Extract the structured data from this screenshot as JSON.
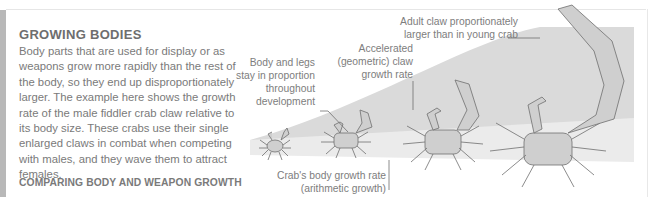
{
  "section": {
    "heading": "GROWING BODIES",
    "body": "Body parts that are used for display or as weapons grow more rapidly than the rest of the body, so they end up disproportionately larger. The example here shows the growth rate of the male fiddler crab claw relative to its body size. These crabs use their single enlarged claws in combat when competing with males, and they wave them to attract females.",
    "subheading": "COMPARING BODY AND WEAPON GROWTH"
  },
  "diagram": {
    "labels": {
      "adult_claw_line1": "Adult claw proportionately",
      "adult_claw_line2": "larger than in young crab",
      "accelerated_line1": "Accelerated",
      "accelerated_line2": "(geometric) claw",
      "accelerated_line3": "growth rate",
      "body_legs_line1": "Body and legs",
      "body_legs_line2": "stay in proportion",
      "body_legs_line3": "throughout",
      "body_legs_line4": "development",
      "body_growth_line1": "Crab's body growth rate",
      "body_growth_line2": "(arithmetic growth)"
    },
    "crabs": [
      {
        "stage": "young",
        "size": "smallest"
      },
      {
        "stage": "juvenile",
        "size": "small"
      },
      {
        "stage": "subadult",
        "size": "medium"
      },
      {
        "stage": "adult",
        "size": "large"
      }
    ],
    "colors": {
      "claw_band": "#d9d9d9",
      "body_band": "#ececec",
      "crab_fill": "#cfcfcf",
      "crab_stroke": "#6f6f6f"
    }
  }
}
